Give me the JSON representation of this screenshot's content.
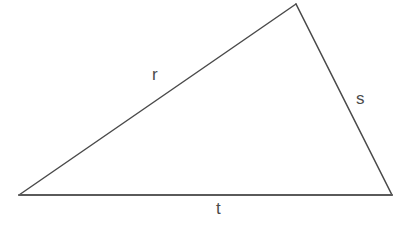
{
  "diagram": {
    "shape": "triangle",
    "background_color": "#ffffff",
    "stroke_color": "#4a4a4a",
    "label_color": "#4b4b4b",
    "vertices": [
      {
        "name": "left-vertex",
        "x": 19,
        "y": 195
      },
      {
        "name": "apex-vertex",
        "x": 296,
        "y": 4
      },
      {
        "name": "right-vertex",
        "x": 392,
        "y": 195
      }
    ],
    "sides": [
      {
        "id": "r",
        "label": "r",
        "from": "left-vertex",
        "to": "apex-vertex",
        "label_position": {
          "x": 152,
          "y": 66
        }
      },
      {
        "id": "s",
        "label": "s",
        "from": "apex-vertex",
        "to": "right-vertex",
        "label_position": {
          "x": 356,
          "y": 90
        }
      },
      {
        "id": "t",
        "label": "t",
        "from": "left-vertex",
        "to": "right-vertex",
        "label_position": {
          "x": 216,
          "y": 200
        }
      }
    ]
  }
}
